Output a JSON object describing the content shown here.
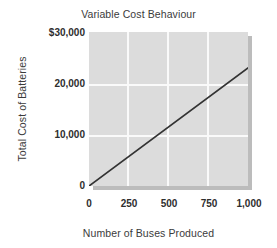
{
  "chart_data": {
    "type": "line",
    "title": "Variable Cost Behaviour",
    "xlabel": "Number of Buses Produced",
    "ylabel": "Total Cost of Batteries",
    "x": [
      0,
      1000
    ],
    "values": [
      0,
      23000
    ],
    "series": [
      {
        "name": "Total Cost of Batteries",
        "x": [
          0,
          1000
        ],
        "values": [
          0,
          23000
        ]
      }
    ],
    "xlim": [
      0,
      1000
    ],
    "ylim": [
      0,
      30000
    ],
    "xticks": [
      0,
      250,
      500,
      750,
      1000
    ],
    "yticks": [
      0,
      10000,
      20000,
      30000
    ],
    "xticklabels": [
      "0",
      "250",
      "500",
      "750",
      "1,000"
    ],
    "yticklabels": [
      "0",
      "10,000",
      "20,000",
      "$30,000"
    ],
    "grid": true,
    "legend": false,
    "legend_position": "none",
    "line_color": "#333333",
    "plot_background": "#dcdcdc",
    "gridline_color": "#fafafa",
    "figure_background": "#ffffff"
  },
  "axis": {
    "y_tick_0": "0",
    "y_tick_1": "10,000",
    "y_tick_2": "20,000",
    "y_tick_3": "$30,000",
    "x_tick_0": "0",
    "x_tick_1": "250",
    "x_tick_2": "500",
    "x_tick_3": "750",
    "x_tick_4": "1,000"
  }
}
